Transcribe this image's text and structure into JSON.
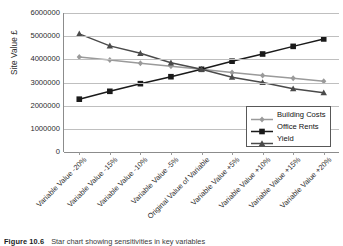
{
  "figure": {
    "caption_number": "Figure 10.6",
    "caption_text": "Star chart showing sensitivities in key variables"
  },
  "axes": {
    "ylabel": "Site Value £",
    "xlabel": "",
    "yticks": [
      "6000000",
      "5000000",
      "4000000",
      "3000000",
      "2000000",
      "1000000",
      "0"
    ]
  },
  "legend": {
    "position": "inside-bottom-right",
    "items": [
      {
        "label": "Building Costs",
        "color": "#9a9a9a",
        "marker": "diamond"
      },
      {
        "label": "Office Rents",
        "color": "#1a1a1a",
        "marker": "square"
      },
      {
        "label": "Yield",
        "color": "#4a4a4a",
        "marker": "triangle"
      }
    ]
  },
  "chart_data": {
    "type": "line",
    "title": "",
    "xlabel": "",
    "ylabel": "Site Value £",
    "ylim": [
      0,
      6000000
    ],
    "ytick_step": 1000000,
    "grid": true,
    "legend_position": "inside-bottom-right",
    "categories": [
      "Variable Value -20%",
      "Variable Value -15%",
      "Variable Value -10%",
      "Variable Value -5%",
      "Original Value of Variable",
      "Variable Value +5%",
      "Variable Value +10%",
      "Variable Value +15%",
      "Variable Value +20%"
    ],
    "series": [
      {
        "name": "Building Costs",
        "color": "#9a9a9a",
        "marker": "diamond",
        "values": [
          4100000,
          3970000,
          3830000,
          3700000,
          3570000,
          3430000,
          3300000,
          3180000,
          3050000
        ]
      },
      {
        "name": "Office Rents",
        "color": "#1a1a1a",
        "marker": "square",
        "values": [
          2280000,
          2620000,
          2950000,
          3250000,
          3570000,
          3920000,
          4230000,
          4560000,
          4880000
        ]
      },
      {
        "name": "Yield",
        "color": "#4a4a4a",
        "marker": "triangle",
        "values": [
          5100000,
          4580000,
          4260000,
          3850000,
          3570000,
          3230000,
          3000000,
          2730000,
          2560000
        ]
      }
    ]
  }
}
